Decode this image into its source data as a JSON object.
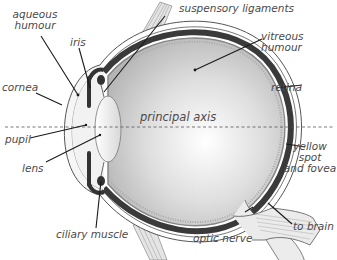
{
  "diagram": {
    "type": "anatomical cross-section",
    "labels": {
      "aqueous_humour_1": "aqueous",
      "aqueous_humour_2": "humour",
      "iris": "iris",
      "suspensory_ligaments": "suspensory ligaments",
      "vitreous_humour_1": "vitreous",
      "vitreous_humour_2": "humour",
      "cornea": "cornea",
      "retina": "retina",
      "principal_axis": "principal axis",
      "pupil": "pupil",
      "lens": "lens",
      "yellow_spot_1": "yellow",
      "yellow_spot_2": "spot",
      "yellow_spot_3": "and fovea",
      "ciliary_muscle": "ciliary muscle",
      "optic_nerve": "optic nerve",
      "to_brain": "to brain"
    },
    "colors": {
      "label_text": "#4a4a4a",
      "leader_line": "#1a1a1a",
      "choroid_dark": "#3a3a3a",
      "vitreous_fill": "#c8c8c8",
      "sclera_outline": "#555555",
      "background": "#ffffff"
    }
  }
}
